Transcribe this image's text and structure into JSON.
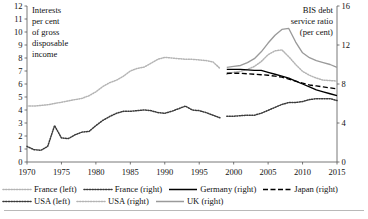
{
  "chart_data": {
    "type": "line",
    "title": "",
    "left_axis": {
      "label": "Interests\nper cent\nof gross\ndisposable\nincome",
      "label_lines": [
        "Interests",
        "per cent",
        "of gross",
        "disposable",
        "income"
      ],
      "ylim": [
        0,
        12
      ],
      "ticks": [
        0,
        1,
        2,
        3,
        4,
        5,
        6,
        7,
        8,
        9,
        10,
        11,
        12
      ]
    },
    "right_axis": {
      "label_lines": [
        "BIS debt",
        "service ratio",
        "(per cent)"
      ],
      "ylim": [
        0,
        16
      ],
      "ticks": [
        0,
        4,
        8,
        12,
        16
      ]
    },
    "xlabel": "",
    "xlim": [
      1970,
      2015
    ],
    "xticks": [
      1970,
      1975,
      1980,
      1985,
      1990,
      1995,
      2000,
      2005,
      2010,
      2015
    ],
    "grid": false,
    "legend_position": "below",
    "series": [
      {
        "name": "France (left)",
        "legend": "France (left)",
        "axis": "left",
        "style": "dotted",
        "color": "#b4b4b4",
        "x": [
          1970,
          1971,
          1972,
          1973,
          1974,
          1975,
          1976,
          1977,
          1978,
          1979,
          1980,
          1981,
          1982,
          1983,
          1984,
          1985,
          1986,
          1987,
          1988,
          1989,
          1990,
          1991,
          1992,
          1993,
          1994,
          1995,
          1996,
          1997,
          1998
        ],
        "values": [
          4.3,
          4.3,
          4.35,
          4.4,
          4.5,
          4.6,
          4.7,
          4.8,
          4.9,
          5.1,
          5.4,
          5.8,
          6.1,
          6.3,
          6.6,
          7.0,
          7.2,
          7.3,
          7.6,
          7.9,
          8.05,
          8.0,
          7.95,
          7.9,
          7.9,
          7.85,
          7.8,
          7.7,
          7.2
        ]
      },
      {
        "name": "USA (left)",
        "legend": "USA (left)",
        "axis": "left",
        "style": "dotted",
        "color": "#3a3a3a",
        "x": [
          1970,
          1971,
          1972,
          1973,
          1974,
          1975,
          1976,
          1977,
          1978,
          1979,
          1980,
          1981,
          1982,
          1983,
          1984,
          1985,
          1986,
          1987,
          1988,
          1989,
          1990,
          1991,
          1992,
          1993,
          1994,
          1995,
          1996,
          1997,
          1998
        ],
        "values": [
          1.2,
          0.95,
          0.9,
          1.2,
          2.8,
          1.85,
          1.8,
          2.1,
          2.3,
          2.35,
          2.8,
          3.2,
          3.5,
          3.75,
          3.9,
          3.9,
          3.95,
          4.0,
          3.95,
          3.8,
          3.75,
          3.9,
          4.1,
          4.3,
          4.0,
          3.95,
          3.8,
          3.6,
          3.4
        ]
      },
      {
        "name": "France (right)",
        "legend": "France (right)",
        "axis": "right",
        "style": "dotted",
        "color": "#3a3a3a",
        "x": [
          1999,
          2000,
          2001,
          2002,
          2003,
          2004,
          2005,
          2006,
          2007,
          2008,
          2009,
          2010,
          2011,
          2012,
          2013,
          2014,
          2015
        ],
        "values": [
          4.7,
          4.7,
          4.75,
          4.8,
          4.8,
          5.0,
          5.3,
          5.6,
          5.9,
          6.1,
          6.1,
          6.2,
          6.4,
          6.5,
          6.5,
          6.5,
          6.3
        ]
      },
      {
        "name": "USA (right)",
        "legend": "USA (right)",
        "axis": "right",
        "style": "dotted",
        "color": "#b4b4b4",
        "x": [
          1999,
          2000,
          2001,
          2002,
          2003,
          2004,
          2005,
          2006,
          2007,
          2008,
          2009,
          2010,
          2011,
          2012,
          2013,
          2014,
          2015
        ],
        "values": [
          9.0,
          9.2,
          9.3,
          9.5,
          9.8,
          10.3,
          11.0,
          11.4,
          11.5,
          10.8,
          10.0,
          9.3,
          8.9,
          8.6,
          8.4,
          8.35,
          8.3
        ]
      },
      {
        "name": "Germany (right)",
        "legend": "Germany (right)",
        "axis": "right",
        "style": "solid",
        "color": "#000000",
        "x": [
          1999,
          2000,
          2001,
          2002,
          2003,
          2004,
          2005,
          2006,
          2007,
          2008,
          2009,
          2010,
          2011,
          2012,
          2013,
          2014,
          2015
        ],
        "values": [
          9.5,
          9.5,
          9.5,
          9.45,
          9.4,
          9.4,
          9.2,
          9.0,
          8.8,
          8.6,
          8.3,
          8.0,
          7.7,
          7.4,
          7.2,
          7.0,
          6.8
        ]
      },
      {
        "name": "Japan (right)",
        "legend": "Japan (right)",
        "axis": "right",
        "style": "dashed",
        "color": "#000000",
        "x": [
          1999,
          2000,
          2001,
          2002,
          2003,
          2004,
          2005,
          2006,
          2007,
          2008,
          2009,
          2010,
          2011,
          2012,
          2013,
          2014,
          2015
        ],
        "values": [
          9.1,
          9.1,
          9.1,
          9.05,
          9.0,
          8.95,
          8.9,
          8.8,
          8.7,
          8.5,
          8.3,
          8.1,
          7.9,
          7.8,
          7.7,
          7.6,
          7.5
        ]
      },
      {
        "name": "UK (right)",
        "legend": "UK (right)",
        "axis": "right",
        "style": "solid",
        "color": "#9a9a9a",
        "x": [
          1999,
          2000,
          2001,
          2002,
          2003,
          2004,
          2005,
          2006,
          2007,
          2008,
          2009,
          2010,
          2011,
          2012,
          2013,
          2014,
          2015
        ],
        "values": [
          9.7,
          9.8,
          9.9,
          10.2,
          10.6,
          11.3,
          12.2,
          13.0,
          13.6,
          13.7,
          12.3,
          11.2,
          10.7,
          10.4,
          10.2,
          10.0,
          9.7
        ]
      }
    ]
  },
  "legend": {
    "rows": [
      [
        {
          "label": "France (left)",
          "style": "dotted",
          "color": "#b4b4b4"
        },
        {
          "label": "France (right)",
          "style": "dotted",
          "color": "#3a3a3a"
        },
        {
          "label": "Germany (right)",
          "style": "solid",
          "color": "#000000"
        },
        {
          "label": "Japan (right)",
          "style": "dashed",
          "color": "#000000"
        }
      ],
      [
        {
          "label": "USA (left)",
          "style": "dotted",
          "color": "#3a3a3a"
        },
        {
          "label": "USA (right)",
          "style": "dotted",
          "color": "#b4b4b4"
        },
        {
          "label": "UK (right)",
          "style": "solid",
          "color": "#9a9a9a"
        }
      ]
    ]
  },
  "footnote": ""
}
